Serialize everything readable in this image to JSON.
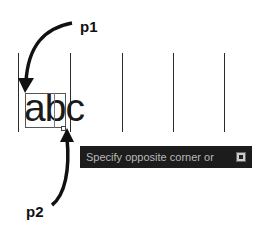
{
  "annotations": {
    "p1_label": "p1",
    "p2_label": "p2"
  },
  "canvas": {
    "text": "abc",
    "grid_lines": [
      18,
      70,
      122,
      173,
      224
    ]
  },
  "tooltip": {
    "prompt": "Specify opposite corner or",
    "icon": "dropdown-arrow-icon"
  }
}
